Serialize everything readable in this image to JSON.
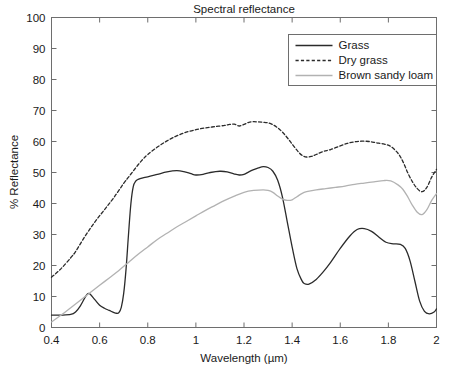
{
  "chart_data": {
    "type": "line",
    "title": "Spectral reflectance",
    "xlabel": "Wavelength (µm)",
    "ylabel": "% Reflectance",
    "xlim": [
      0.4,
      2.0
    ],
    "ylim": [
      0,
      100
    ],
    "xticks": [
      0.4,
      0.6,
      0.8,
      1.0,
      1.2,
      1.4,
      1.6,
      1.8,
      2.0
    ],
    "xtick_labels": [
      "0.4",
      "0.6",
      "0.8",
      "1",
      "1.2",
      "1.4",
      "1.6",
      "1.8",
      "2"
    ],
    "yticks": [
      0,
      10,
      20,
      30,
      40,
      50,
      60,
      70,
      80,
      90,
      100
    ],
    "ytick_labels": [
      "0",
      "10",
      "20",
      "30",
      "40",
      "50",
      "60",
      "70",
      "80",
      "90",
      "100"
    ],
    "grid": false,
    "legend_position": "upper right",
    "series": [
      {
        "name": "Grass",
        "color": "#2b2b2b",
        "style": "solid",
        "width": 1.3,
        "x": [
          0.4,
          0.44,
          0.48,
          0.5,
          0.52,
          0.54,
          0.55,
          0.56,
          0.58,
          0.6,
          0.62,
          0.64,
          0.66,
          0.67,
          0.68,
          0.69,
          0.7,
          0.71,
          0.72,
          0.73,
          0.74,
          0.75,
          0.76,
          0.78,
          0.8,
          0.84,
          0.88,
          0.92,
          0.95,
          0.98,
          1.0,
          1.03,
          1.06,
          1.1,
          1.13,
          1.16,
          1.18,
          1.2,
          1.22,
          1.24,
          1.26,
          1.28,
          1.3,
          1.32,
          1.34,
          1.36,
          1.38,
          1.4,
          1.42,
          1.44,
          1.45,
          1.47,
          1.5,
          1.53,
          1.56,
          1.6,
          1.64,
          1.67,
          1.7,
          1.73,
          1.76,
          1.79,
          1.82,
          1.85,
          1.87,
          1.89,
          1.91,
          1.93,
          1.95,
          1.97,
          1.99,
          2.0
        ],
        "y": [
          4.0,
          4.0,
          4.2,
          5.0,
          7.0,
          9.8,
          10.9,
          10.8,
          9.0,
          7.2,
          6.2,
          5.5,
          4.8,
          4.6,
          4.8,
          6.5,
          11.0,
          19.0,
          30.0,
          40.0,
          45.5,
          47.2,
          47.8,
          48.3,
          48.6,
          49.4,
          50.2,
          50.6,
          50.3,
          49.6,
          49.2,
          49.4,
          50.0,
          50.4,
          50.2,
          49.5,
          49.2,
          49.4,
          50.2,
          50.9,
          51.5,
          51.9,
          51.6,
          50.4,
          47.5,
          42.0,
          34.0,
          26.0,
          19.0,
          15.2,
          14.2,
          14.0,
          15.5,
          18.0,
          21.0,
          25.5,
          29.5,
          31.6,
          31.9,
          31.0,
          29.2,
          27.5,
          27.0,
          26.8,
          25.5,
          21.5,
          15.0,
          8.5,
          5.2,
          4.4,
          5.0,
          6.0
        ]
      },
      {
        "name": "Dry grass",
        "color": "#2b2b2b",
        "style": "dashed",
        "width": 1.3,
        "x": [
          0.4,
          0.44,
          0.48,
          0.5,
          0.54,
          0.58,
          0.62,
          0.66,
          0.7,
          0.72,
          0.74,
          0.76,
          0.78,
          0.8,
          0.84,
          0.88,
          0.92,
          0.96,
          1.0,
          1.04,
          1.08,
          1.12,
          1.14,
          1.16,
          1.18,
          1.2,
          1.22,
          1.24,
          1.26,
          1.28,
          1.3,
          1.32,
          1.34,
          1.36,
          1.38,
          1.4,
          1.42,
          1.44,
          1.46,
          1.48,
          1.5,
          1.53,
          1.56,
          1.6,
          1.63,
          1.66,
          1.69,
          1.72,
          1.75,
          1.78,
          1.81,
          1.84,
          1.86,
          1.88,
          1.9,
          1.92,
          1.94,
          1.96,
          1.98,
          2.0
        ],
        "y": [
          16.2,
          19.0,
          22.5,
          24.5,
          29.5,
          34.0,
          38.0,
          42.0,
          46.5,
          48.5,
          50.5,
          52.5,
          54.3,
          55.8,
          58.2,
          60.2,
          61.8,
          63.0,
          63.8,
          64.4,
          64.8,
          65.2,
          65.5,
          65.6,
          65.0,
          65.5,
          66.2,
          66.4,
          66.3,
          66.2,
          66.0,
          65.4,
          64.4,
          63.0,
          61.2,
          59.2,
          57.2,
          55.6,
          55.0,
          55.2,
          55.8,
          56.8,
          57.4,
          58.6,
          59.4,
          59.9,
          60.1,
          60.0,
          59.6,
          59.2,
          58.4,
          56.2,
          53.6,
          50.0,
          47.0,
          44.8,
          43.8,
          45.2,
          48.5,
          51.0
        ]
      },
      {
        "name": "Brown sandy loam",
        "color": "#b2b2b2",
        "style": "solid",
        "width": 1.3,
        "x": [
          0.4,
          0.44,
          0.48,
          0.52,
          0.56,
          0.6,
          0.64,
          0.68,
          0.72,
          0.76,
          0.8,
          0.84,
          0.88,
          0.92,
          0.96,
          1.0,
          1.04,
          1.08,
          1.12,
          1.16,
          1.2,
          1.24,
          1.28,
          1.3,
          1.32,
          1.34,
          1.36,
          1.38,
          1.4,
          1.42,
          1.44,
          1.46,
          1.5,
          1.54,
          1.58,
          1.62,
          1.66,
          1.7,
          1.74,
          1.78,
          1.81,
          1.84,
          1.86,
          1.88,
          1.9,
          1.92,
          1.94,
          1.96,
          1.98,
          2.0
        ],
        "y": [
          1.8,
          4.0,
          6.4,
          8.8,
          11.2,
          13.6,
          16.0,
          18.4,
          21.0,
          23.6,
          26.0,
          28.4,
          30.4,
          32.4,
          34.2,
          36.0,
          37.8,
          39.4,
          41.0,
          42.4,
          43.6,
          44.2,
          44.4,
          44.2,
          43.6,
          42.4,
          41.4,
          41.0,
          41.2,
          42.2,
          43.2,
          43.8,
          44.4,
          44.8,
          45.2,
          45.6,
          46.2,
          46.6,
          47.0,
          47.4,
          47.3,
          46.0,
          44.6,
          42.2,
          39.4,
          37.2,
          36.4,
          38.0,
          41.0,
          43.2
        ]
      }
    ]
  },
  "axes": {
    "title": "Spectral reflectance",
    "xlabel": "Wavelength (µm)",
    "ylabel": "% Reflectance"
  },
  "legend": {
    "items": [
      {
        "label": "Grass"
      },
      {
        "label": "Dry grass"
      },
      {
        "label": "Brown sandy loam"
      }
    ]
  }
}
